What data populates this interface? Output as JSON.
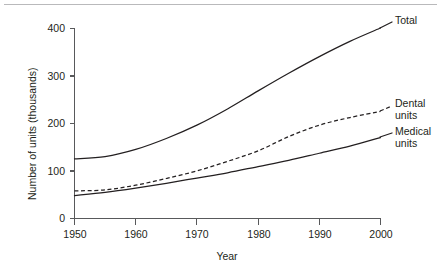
{
  "chart_data": {
    "type": "line",
    "title": "",
    "xlabel": "Year",
    "ylabel": "Number of units (thousands)",
    "xlim": [
      1950,
      2000
    ],
    "ylim": [
      0,
      400
    ],
    "xticks": [
      "1950",
      "1960",
      "1970",
      "1980",
      "1990",
      "2000"
    ],
    "yticks": [
      "0",
      "100",
      "200",
      "300",
      "400"
    ],
    "grid": false,
    "legend_position": "right-inline",
    "x": [
      1950,
      1955,
      1960,
      1965,
      1970,
      1975,
      1980,
      1985,
      1990,
      1995,
      2000
    ],
    "series": [
      {
        "name": "Total",
        "label": "Total",
        "style": "solid",
        "values": [
          125,
          130,
          145,
          168,
          196,
          230,
          268,
          305,
          340,
          372,
          400
        ]
      },
      {
        "name": "Dental units",
        "label_line1": "Dental",
        "label_line2": "units",
        "style": "dashed",
        "values": [
          58,
          60,
          70,
          84,
          100,
          120,
          142,
          172,
          196,
          212,
          225
        ]
      },
      {
        "name": "Medical units",
        "label_line1": "Medical",
        "label_line2": "units",
        "style": "solid",
        "values": [
          48,
          55,
          64,
          74,
          85,
          96,
          109,
          122,
          137,
          152,
          170
        ]
      }
    ]
  },
  "axis": {
    "x_title": "Year",
    "y_title": "Number of units (thousands)",
    "xtick_1950": "1950",
    "xtick_1960": "1960",
    "xtick_1970": "1970",
    "xtick_1980": "1980",
    "xtick_1990": "1990",
    "xtick_2000": "2000",
    "ytick_0": "0",
    "ytick_100": "100",
    "ytick_200": "200",
    "ytick_300": "300",
    "ytick_400": "400"
  },
  "labels": {
    "total": "Total",
    "dental_line1": "Dental",
    "dental_line2": "units",
    "medical_line1": "Medical",
    "medical_line2": "units"
  },
  "colors": {
    "ink": "#231f20",
    "axis": "#58595b",
    "rule": "#b9b9bb",
    "background": "#ffffff"
  }
}
